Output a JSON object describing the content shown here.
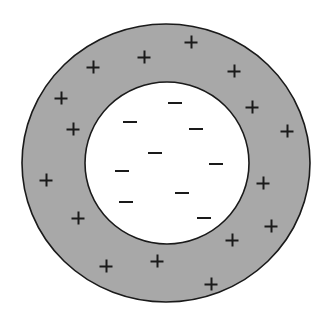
{
  "diagram": {
    "colors": {
      "background": "#ffffff",
      "outer_shell_fill": "#a8a8a8",
      "inner_fill": "#ffffff",
      "stroke": "#1a1a1a",
      "charge_color": "#1a1a1a"
    },
    "outer_shell": {
      "cx": 166,
      "cy": 163,
      "rx": 144,
      "ry": 139
    },
    "inner_region": {
      "cx": 167,
      "cy": 163,
      "rx": 82,
      "ry": 81
    },
    "positive_charges": [
      {
        "x": 144,
        "y": 57
      },
      {
        "x": 93,
        "y": 67
      },
      {
        "x": 61,
        "y": 98
      },
      {
        "x": 73,
        "y": 129
      },
      {
        "x": 191,
        "y": 42
      },
      {
        "x": 234,
        "y": 71
      },
      {
        "x": 252,
        "y": 107
      },
      {
        "x": 287,
        "y": 131
      },
      {
        "x": 46,
        "y": 180
      },
      {
        "x": 78,
        "y": 218
      },
      {
        "x": 106,
        "y": 266
      },
      {
        "x": 157,
        "y": 261
      },
      {
        "x": 263,
        "y": 183
      },
      {
        "x": 271,
        "y": 226
      },
      {
        "x": 232,
        "y": 240
      },
      {
        "x": 211,
        "y": 284
      }
    ],
    "negative_charges": [
      {
        "x": 175,
        "y": 103
      },
      {
        "x": 130,
        "y": 122
      },
      {
        "x": 196,
        "y": 129
      },
      {
        "x": 155,
        "y": 153
      },
      {
        "x": 122,
        "y": 171
      },
      {
        "x": 216,
        "y": 164
      },
      {
        "x": 182,
        "y": 193
      },
      {
        "x": 126,
        "y": 202
      },
      {
        "x": 204,
        "y": 218
      }
    ],
    "positive_symbol": "+",
    "negative_symbol": "−"
  }
}
